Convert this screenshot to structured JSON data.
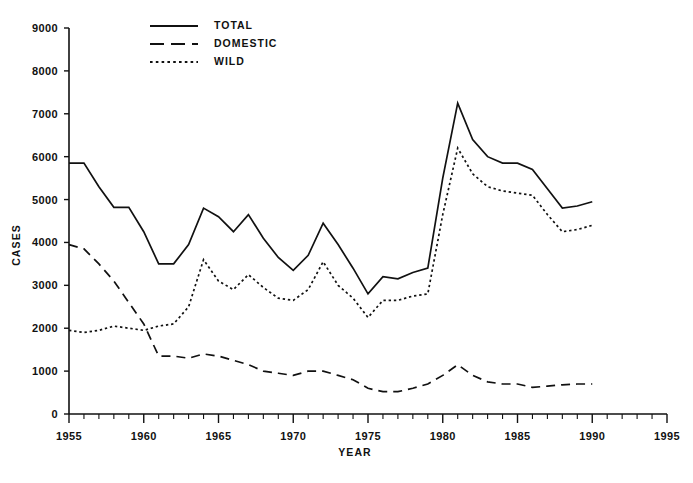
{
  "chart_data": {
    "type": "line",
    "title": "",
    "xlabel": "YEAR",
    "ylabel": "CASES",
    "xlim": [
      1955,
      1995
    ],
    "ylim": [
      0,
      9000
    ],
    "grid": false,
    "legend_position": "top-left",
    "x_ticks": [
      1955,
      1960,
      1965,
      1970,
      1975,
      1980,
      1985,
      1990,
      1995
    ],
    "x_tick_labels": [
      "1955",
      "1960",
      "1965",
      "1970",
      "1975",
      "1980",
      "1985",
      "1990",
      "1995"
    ],
    "x_minor_tick_step": 1,
    "y_ticks": [
      0,
      1000,
      2000,
      3000,
      4000,
      5000,
      6000,
      7000,
      8000,
      9000
    ],
    "y_tick_labels": [
      "0",
      "1000",
      "2000",
      "3000",
      "4000",
      "5000",
      "6000",
      "7000",
      "8000",
      "9000"
    ],
    "x": [
      1955,
      1956,
      1957,
      1958,
      1959,
      1960,
      1961,
      1962,
      1963,
      1964,
      1965,
      1966,
      1967,
      1968,
      1969,
      1970,
      1971,
      1972,
      1973,
      1974,
      1975,
      1976,
      1977,
      1978,
      1979,
      1980,
      1981,
      1982,
      1983,
      1984,
      1985,
      1986,
      1987,
      1988,
      1989,
      1990
    ],
    "series": [
      {
        "name": "TOTAL",
        "style": "solid",
        "color": "#111111",
        "values": [
          5850,
          5850,
          5300,
          4820,
          4820,
          4250,
          3500,
          3500,
          3950,
          4800,
          4600,
          4250,
          4650,
          4100,
          3650,
          3350,
          3700,
          4450,
          3950,
          3400,
          2800,
          3200,
          3150,
          3300,
          3400,
          5500,
          7250,
          6400,
          6000,
          5850,
          5850,
          5700,
          5250,
          4800,
          4850,
          4950
        ]
      },
      {
        "name": "DOMESTIC",
        "style": "dashed",
        "color": "#111111",
        "values": [
          3950,
          3850,
          3500,
          3100,
          2600,
          2100,
          1350,
          1350,
          1300,
          1400,
          1350,
          1250,
          1150,
          1000,
          950,
          900,
          1000,
          1000,
          900,
          800,
          600,
          520,
          520,
          600,
          700,
          900,
          1150,
          900,
          750,
          700,
          700,
          620,
          650,
          680,
          700,
          700
        ]
      },
      {
        "name": "WILD",
        "style": "dotted",
        "color": "#111111",
        "values": [
          1950,
          1900,
          1950,
          2050,
          2000,
          1950,
          2050,
          2100,
          2500,
          3600,
          3100,
          2900,
          3250,
          2950,
          2700,
          2650,
          2900,
          3550,
          3000,
          2700,
          2250,
          2650,
          2650,
          2750,
          2800,
          4650,
          6200,
          5600,
          5300,
          5200,
          5150,
          5100,
          4650,
          4250,
          4300,
          4400
        ]
      }
    ]
  },
  "legend": {
    "entries": [
      {
        "label": "TOTAL",
        "style": "solid"
      },
      {
        "label": "DOMESTIC",
        "style": "dashed"
      },
      {
        "label": "WILD",
        "style": "dotted"
      }
    ]
  }
}
